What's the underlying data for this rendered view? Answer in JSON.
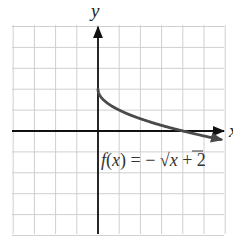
{
  "chart_data": {
    "type": "line",
    "title": "",
    "xlabel": "x",
    "ylabel": "y",
    "xlim": [
      -4,
      6
    ],
    "ylim": [
      -5,
      5
    ],
    "grid": true,
    "grid_step": 1,
    "series": [
      {
        "name": "f(x) = -√x + 2",
        "function": "-sqrt(x) + 2",
        "domain_start": 0,
        "x": [
          0,
          0.25,
          0.5,
          1,
          1.5,
          2,
          2.5,
          3,
          3.5,
          4,
          4.5,
          5,
          5.8
        ],
        "values": [
          2,
          1.5,
          1.29,
          1,
          0.78,
          0.59,
          0.42,
          0.27,
          0.13,
          0,
          -0.12,
          -0.24,
          -0.41
        ],
        "color": "#4a4a4a",
        "end_arrow": true
      }
    ],
    "annotations": [
      {
        "text": "f(x) = − √x + 2",
        "x": 0.2,
        "y": -1.6
      }
    ]
  },
  "labels": {
    "y_axis": "y",
    "x_axis": "x",
    "func_f": "f",
    "func_open": "(",
    "func_x": "x",
    "func_close": ")",
    "func_eq": " = − ",
    "func_sqrt": "√",
    "func_radicand": "x",
    "func_tail": " + 2"
  },
  "colors": {
    "grid": "#cfcfcf",
    "axis": "#111111",
    "curve": "#4a4a4a",
    "background": "#ffffff"
  }
}
